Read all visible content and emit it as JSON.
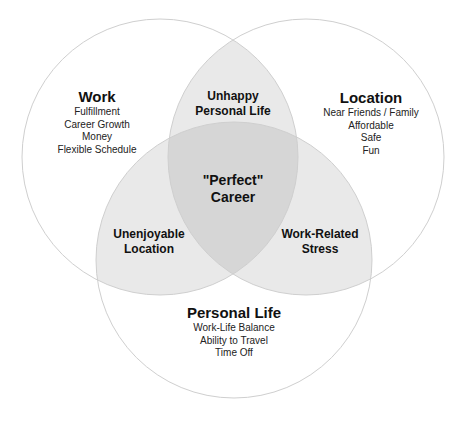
{
  "colors": {
    "background": "#ffffff",
    "circle_stroke": "#cfcfcf",
    "circle_fill": "#d8d8d8",
    "text": "#111111"
  },
  "sets": {
    "work": {
      "title": "Work",
      "items": [
        "Fulfillment",
        "Career Growth",
        "Money",
        "Flexible Schedule"
      ]
    },
    "location": {
      "title": "Location",
      "items": [
        "Near Friends / Family",
        "Affordable",
        "Safe",
        "Fun"
      ]
    },
    "personal_life": {
      "title": "Personal Life",
      "items": [
        "Work-Life Balance",
        "Ability to Travel",
        "Time Off"
      ]
    }
  },
  "overlaps": {
    "work_location": [
      "Unhappy",
      "Personal Life"
    ],
    "work_personal": [
      "Unenjoyable",
      "Location"
    ],
    "location_personal": [
      "Work-Related",
      "Stress"
    ],
    "all": [
      "\"Perfect\"",
      "Career"
    ]
  }
}
